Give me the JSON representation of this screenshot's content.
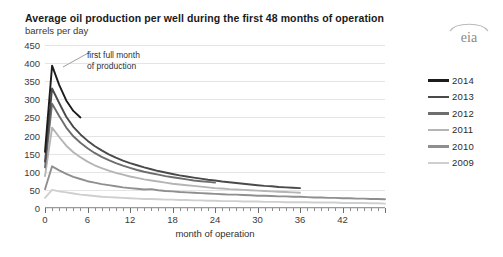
{
  "header": {
    "title": "Average oil production per well during the first 48 months of operation",
    "subtitle": "barrels per day",
    "logo_text": "eia"
  },
  "annotation": {
    "line1": "first full month",
    "line2": "of production"
  },
  "chart_data": {
    "type": "line",
    "title": "Average oil production per well during the first 48 months of operation",
    "subtitle": "barrels per day",
    "xlabel": "month of operation",
    "ylabel": "barrels per day",
    "xlim": [
      0,
      48
    ],
    "ylim": [
      0,
      450
    ],
    "ytick_step": 50,
    "yticks": [
      "450",
      "400",
      "350",
      "300",
      "250",
      "200",
      "150",
      "100",
      "50",
      "0"
    ],
    "xticks": [
      "0",
      "6",
      "12",
      "18",
      "24",
      "30",
      "36",
      "42"
    ],
    "xtick_minor_step": 1,
    "grid": true,
    "legend_position": "right",
    "annotation_text": "first full month of production",
    "annotation_target_month": 1,
    "series": [
      {
        "name": "2014",
        "color": "#1c1c1c",
        "x": [
          0,
          1,
          2,
          3,
          4,
          5
        ],
        "values": [
          155,
          393,
          340,
          297,
          268,
          250
        ]
      },
      {
        "name": "2013",
        "color": "#4a4a4a",
        "x": [
          0,
          1,
          2,
          3,
          4,
          5,
          6,
          7,
          8,
          9,
          10,
          11,
          12,
          13,
          14,
          15,
          16,
          17,
          18,
          19,
          20,
          21,
          22,
          23,
          24,
          25,
          26,
          27,
          28,
          29,
          30,
          31,
          32,
          33,
          34,
          35,
          36
        ],
        "values": [
          128,
          330,
          290,
          252,
          224,
          203,
          186,
          171,
          159,
          148,
          139,
          131,
          124,
          118,
          112,
          107,
          102,
          98,
          94,
          90,
          87,
          84,
          81,
          78,
          76,
          73,
          71,
          69,
          67,
          65,
          63,
          61,
          60,
          58,
          57,
          56,
          55
        ]
      },
      {
        "name": "2012",
        "color": "#6e6e6e",
        "x": [
          0,
          1,
          2,
          3,
          4,
          5,
          6,
          7,
          8,
          9,
          10,
          11,
          12,
          13,
          14,
          15,
          16,
          17,
          18,
          19,
          20,
          21,
          22,
          23,
          24
        ],
        "values": [
          112,
          288,
          254,
          222,
          198,
          180,
          165,
          152,
          141,
          132,
          124,
          117,
          111,
          105,
          100,
          96,
          92,
          88,
          85,
          82,
          79,
          76,
          74,
          72,
          70
        ]
      },
      {
        "name": "2011",
        "color": "#b5b5b5",
        "x": [
          0,
          1,
          2,
          3,
          4,
          5,
          6,
          7,
          8,
          9,
          10,
          11,
          12,
          13,
          14,
          15,
          16,
          17,
          18,
          19,
          20,
          21,
          22,
          23,
          24,
          25,
          26,
          27,
          28,
          29,
          30,
          31,
          32,
          33,
          34,
          35,
          36
        ],
        "values": [
          88,
          222,
          196,
          172,
          154,
          140,
          128,
          118,
          110,
          103,
          97,
          92,
          87,
          83,
          79,
          76,
          73,
          70,
          67,
          65,
          63,
          61,
          59,
          57,
          55,
          54,
          52,
          51,
          50,
          49,
          48,
          47,
          46,
          45,
          44,
          43,
          42
        ]
      },
      {
        "name": "2010",
        "color": "#8f8f8f",
        "x": [
          0,
          1,
          2,
          3,
          4,
          5,
          6,
          7,
          8,
          9,
          10,
          11,
          12,
          13,
          14,
          15,
          16,
          17,
          18,
          19,
          20,
          21,
          22,
          23,
          24,
          25,
          26,
          27,
          28,
          29,
          30,
          31,
          32,
          33,
          34,
          35,
          36,
          37,
          38,
          39,
          40,
          41,
          42,
          43,
          44,
          45,
          46,
          47,
          48
        ],
        "values": [
          52,
          115,
          104,
          94,
          86,
          80,
          74,
          70,
          66,
          63,
          60,
          57,
          55,
          53,
          51,
          52,
          49,
          47,
          46,
          44,
          43,
          42,
          41,
          40,
          39,
          38,
          37,
          37,
          36,
          35,
          34,
          34,
          33,
          32,
          32,
          31,
          31,
          30,
          29,
          29,
          28,
          28,
          27,
          27,
          26,
          26,
          25,
          25,
          24
        ]
      },
      {
        "name": "2009",
        "color": "#cfcfcf",
        "x": [
          0,
          1,
          2,
          3,
          4,
          5,
          6,
          7,
          8,
          9,
          10,
          11,
          12,
          13,
          14,
          15,
          16,
          17,
          18,
          19,
          20,
          21,
          22,
          23,
          24,
          25,
          26,
          27,
          28,
          29,
          30,
          31,
          32,
          33,
          34,
          35,
          36,
          37,
          38,
          39,
          40,
          41,
          42,
          43,
          44,
          45,
          46,
          47,
          48
        ],
        "values": [
          28,
          50,
          46,
          43,
          40,
          37,
          35,
          33,
          31,
          30,
          29,
          28,
          27,
          26,
          25,
          25,
          24,
          23,
          23,
          22,
          22,
          21,
          21,
          20,
          20,
          19,
          19,
          19,
          18,
          18,
          18,
          17,
          17,
          17,
          16,
          16,
          16,
          16,
          15,
          15,
          15,
          15,
          14,
          14,
          14,
          14,
          13,
          13,
          12
        ]
      }
    ]
  }
}
